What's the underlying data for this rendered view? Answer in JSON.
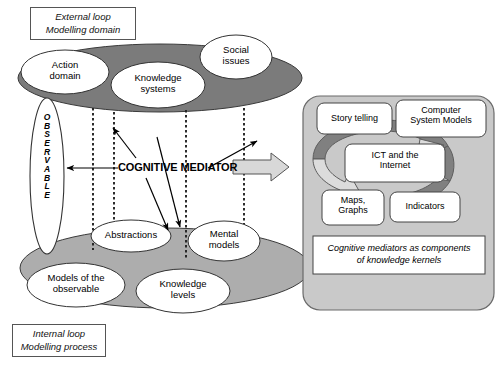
{
  "figure": {
    "background_color": "#ffffff"
  },
  "colors": {
    "dark_gray_ellipse": "#7b7b7b",
    "light_gray_ellipse": "#adadad",
    "panel_gray": "#c9c9c9",
    "arrow_light": "#d8d8d8",
    "arrow_dark": "#808080",
    "white": "#ffffff",
    "stroke": "#333333"
  },
  "legends": {
    "top": {
      "line1": "External loop",
      "line2": "Modelling domain"
    },
    "bottom": {
      "line1": "Internal loop",
      "line2": "Modelling process"
    }
  },
  "observable": {
    "text": "OBSERVABLE",
    "letters": [
      "O",
      "B",
      "S",
      "E",
      "R",
      "V",
      "A",
      "B",
      "L",
      "E"
    ]
  },
  "center": {
    "label": "COGNITIVE MEDIATOR"
  },
  "domain_layer": {
    "name": "Modelling domain ellipse",
    "nodes": [
      {
        "label_line1": "Action",
        "label_line2": "domain"
      },
      {
        "label_line1": "Knowledge",
        "label_line2": "systems"
      },
      {
        "label_line1": "Social",
        "label_line2": "issues"
      }
    ]
  },
  "process_layer": {
    "name": "Modelling process ellipse",
    "nodes": [
      {
        "label_line1": "Abstractions",
        "label_line2": ""
      },
      {
        "label_line1": "Mental",
        "label_line2": "models"
      },
      {
        "label_line1": "Models of the",
        "label_line2": "observable"
      },
      {
        "label_line1": "Knowledge",
        "label_line2": "levels"
      }
    ]
  },
  "kernel_panel": {
    "items": [
      {
        "label_line1": "Story telling",
        "label_line2": ""
      },
      {
        "label_line1": "Computer",
        "label_line2": "System Models"
      },
      {
        "label_line1": "ICT and the",
        "label_line2": "Internet"
      },
      {
        "label_line1": "Maps,",
        "label_line2": "Graphs"
      },
      {
        "label_line1": "Indicators",
        "label_line2": ""
      }
    ],
    "caption": {
      "line1": "Cognitive mediators as components",
      "line2": "of  knowledge kernels"
    },
    "cycle_arrow_name": "circular-cycle-arrow"
  },
  "connectors": {
    "to_observable": "arrow-left-to-observable",
    "to_knowledge_systems": "arrow-up-to-knowledge-systems",
    "to_social_issues": "arrow-up-right-to-social-issues",
    "to_abstractions": "arrow-down-to-abstractions",
    "to_mental_models": "arrow-down-right-to-mental-models",
    "to_panel": "block-arrow-right-to-kernel-panel",
    "dotted_guides": [
      "guide-1",
      "guide-2",
      "guide-3",
      "guide-4"
    ]
  }
}
